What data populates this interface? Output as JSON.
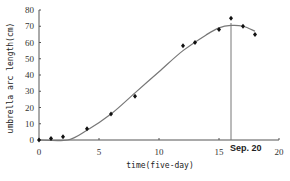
{
  "chart_data": {
    "type": "scatter",
    "title": "",
    "xlabel": "time(five-day)",
    "ylabel": "umbrella arc length(cm)",
    "xlim": [
      0,
      20
    ],
    "ylim": [
      0,
      80
    ],
    "xticks": [
      0,
      5,
      10,
      15,
      20
    ],
    "yticks": [
      0,
      10,
      20,
      30,
      40,
      50,
      60,
      70,
      80
    ],
    "grid": false,
    "legend": null,
    "series": [
      {
        "name": "observed",
        "kind": "scatter",
        "marker": "diamond",
        "x": [
          0,
          1,
          2,
          4,
          6,
          8,
          12,
          13,
          15,
          16,
          17,
          18
        ],
        "y": [
          0,
          1,
          2,
          7,
          16,
          27,
          58,
          60,
          68,
          75,
          70,
          65
        ]
      },
      {
        "name": "fitted curve",
        "kind": "line",
        "x": [
          0,
          2.4,
          4,
          6,
          8,
          10,
          12,
          14,
          15,
          16,
          17,
          18
        ],
        "y": [
          0,
          0,
          6,
          16,
          29,
          42,
          55,
          65,
          69,
          70.5,
          70,
          67
        ]
      }
    ],
    "annotations": [
      {
        "type": "vline",
        "x": 16,
        "label": "Sep. 20"
      }
    ]
  },
  "colors": {
    "axis": "#555555",
    "curve": "#777777",
    "points": "#111111",
    "vline": "#777777"
  }
}
